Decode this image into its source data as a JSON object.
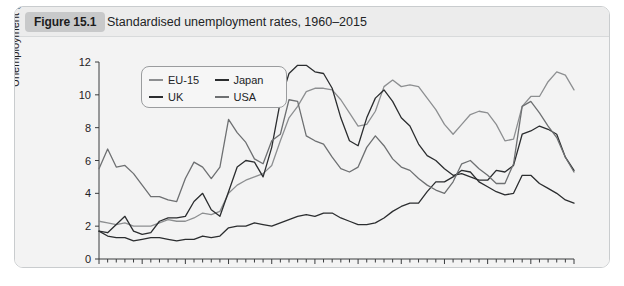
{
  "figure": {
    "badge": "Figure 15.1",
    "title": "Standardised unemployment rates, 1960–2015"
  },
  "legend": {
    "entries": [
      {
        "label": "EU-15",
        "color": "#8d8f91"
      },
      {
        "label": "Japan",
        "color": "#2b2d2f"
      },
      {
        "label": "UK",
        "color": "#2b2d2f"
      },
      {
        "label": "USA",
        "color": "#6e7072"
      }
    ]
  },
  "axes": {
    "ylabel": "Unemployment (% of workforce)",
    "yticks": [
      "0",
      "2",
      "4",
      "6",
      "8",
      "10",
      "12"
    ],
    "xticks": [
      "1960",
      "1965",
      "1970",
      "1975",
      "1980",
      "1985",
      "1990",
      "1995",
      "2000",
      "2005",
      "2010",
      "2015"
    ]
  },
  "chart_data": {
    "type": "line",
    "title": "Standardised unemployment rates, 1960–2015",
    "xlabel": "",
    "ylabel": "Unemployment (% of workforce)",
    "xlim": [
      1960,
      2015
    ],
    "ylim": [
      0,
      12
    ],
    "grid": false,
    "legend_position": "top-left-inside",
    "x": [
      1960,
      1961,
      1962,
      1963,
      1964,
      1965,
      1966,
      1967,
      1968,
      1969,
      1970,
      1971,
      1972,
      1973,
      1974,
      1975,
      1976,
      1977,
      1978,
      1979,
      1980,
      1981,
      1982,
      1983,
      1984,
      1985,
      1986,
      1987,
      1988,
      1989,
      1990,
      1991,
      1992,
      1993,
      1994,
      1995,
      1996,
      1997,
      1998,
      1999,
      2000,
      2001,
      2002,
      2003,
      2004,
      2005,
      2006,
      2007,
      2008,
      2009,
      2010,
      2011,
      2012,
      2013,
      2014,
      2015
    ],
    "series": [
      {
        "name": "EU-15",
        "color": "#8d8f91",
        "values": [
          2.3,
          2.2,
          2.1,
          2.2,
          2.0,
          2.0,
          2.0,
          2.2,
          2.4,
          2.3,
          2.3,
          2.5,
          2.8,
          2.7,
          2.9,
          4.0,
          4.5,
          4.8,
          5.0,
          5.2,
          5.7,
          7.2,
          8.6,
          9.3,
          10.2,
          10.4,
          10.4,
          10.3,
          9.7,
          8.9,
          8.1,
          8.2,
          9.0,
          10.5,
          10.9,
          10.5,
          10.6,
          10.5,
          9.8,
          9.1,
          8.2,
          7.6,
          8.2,
          8.8,
          9.0,
          8.9,
          8.2,
          7.2,
          7.3,
          9.3,
          9.9,
          9.9,
          10.8,
          11.4,
          11.2,
          10.3
        ]
      },
      {
        "name": "UK",
        "color": "#2b2d2f",
        "values": [
          1.7,
          1.6,
          2.1,
          2.6,
          1.7,
          1.5,
          1.6,
          2.3,
          2.5,
          2.5,
          2.6,
          3.5,
          4.0,
          3.0,
          2.6,
          4.1,
          5.6,
          6.0,
          5.9,
          5.0,
          6.8,
          9.6,
          11.3,
          11.8,
          11.8,
          11.4,
          11.3,
          10.4,
          8.6,
          7.2,
          6.9,
          8.6,
          9.8,
          10.3,
          9.6,
          8.6,
          8.1,
          7.0,
          6.3,
          6.0,
          5.5,
          5.1,
          5.2,
          5.0,
          4.8,
          4.8,
          5.4,
          5.3,
          5.7,
          7.6,
          7.8,
          8.1,
          7.9,
          7.6,
          6.2,
          5.4
        ]
      },
      {
        "name": "Japan",
        "color": "#2b2d2f",
        "values": [
          1.7,
          1.4,
          1.3,
          1.3,
          1.1,
          1.2,
          1.3,
          1.3,
          1.2,
          1.1,
          1.2,
          1.2,
          1.4,
          1.3,
          1.4,
          1.9,
          2.0,
          2.0,
          2.2,
          2.1,
          2.0,
          2.2,
          2.4,
          2.6,
          2.7,
          2.6,
          2.8,
          2.8,
          2.5,
          2.3,
          2.1,
          2.1,
          2.2,
          2.5,
          2.9,
          3.2,
          3.4,
          3.4,
          4.1,
          4.7,
          4.7,
          5.0,
          5.4,
          5.3,
          4.7,
          4.4,
          4.1,
          3.9,
          4.0,
          5.1,
          5.1,
          4.6,
          4.3,
          4.0,
          3.6,
          3.4
        ]
      },
      {
        "name": "USA",
        "color": "#6e7072",
        "values": [
          5.5,
          6.7,
          5.6,
          5.7,
          5.2,
          4.5,
          3.8,
          3.8,
          3.6,
          3.5,
          4.9,
          5.9,
          5.6,
          4.9,
          5.6,
          8.5,
          7.7,
          7.1,
          6.1,
          5.8,
          7.2,
          7.6,
          9.7,
          9.6,
          7.5,
          7.2,
          7.0,
          6.2,
          5.5,
          5.3,
          5.6,
          6.8,
          7.5,
          6.9,
          6.1,
          5.6,
          5.4,
          4.9,
          4.5,
          4.2,
          4.0,
          4.7,
          5.8,
          6.0,
          5.5,
          5.1,
          4.6,
          4.6,
          5.8,
          9.3,
          9.6,
          8.9,
          8.1,
          7.4,
          6.2,
          5.3
        ]
      }
    ]
  }
}
